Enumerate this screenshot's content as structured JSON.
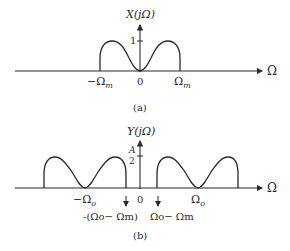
{
  "figure_a": {
    "ylabel": "X(jΩ)",
    "xlabel": "Ω",
    "ytick": "1",
    "xticks": {
      "neg": "−Ω",
      "neg_sub": "m",
      "zero": "0",
      "pos": "Ω",
      "pos_sub": "m"
    },
    "caption": "(a)"
  },
  "figure_b": {
    "ylabel": "Y(jΩ)",
    "xlabel": "Ω",
    "ytick_num": "A",
    "ytick_den": "2",
    "xticks": {
      "neg": "−Ω",
      "neg_sub": "o",
      "zero": "0",
      "pos": "Ω",
      "pos_sub": "o"
    },
    "arrow_labels": {
      "left": "-(Ωo− Ωm)",
      "right": "Ωo− Ωm"
    },
    "caption": "(b)"
  },
  "colors": {
    "ink": "#2a2a2a",
    "background": "#ffffff"
  }
}
